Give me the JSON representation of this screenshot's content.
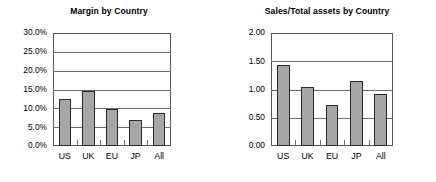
{
  "figure": {
    "background": "#ffffff",
    "bar_fill": "#a6a6a6",
    "bar_edge": "#2b2b2b",
    "grid_color": "#6d6e70",
    "axis_color": "#58585a"
  },
  "chart_data": [
    {
      "type": "bar",
      "title": "Margin by Country",
      "xlabel": "",
      "ylabel": "",
      "categories": [
        "US",
        "UK",
        "EU",
        "JP",
        "All"
      ],
      "values": [
        0.126,
        0.145,
        0.099,
        0.07,
        0.088
      ],
      "value_labels": [
        "12.6%",
        "14.5%",
        "9.9%",
        "7.0%",
        "8.8%"
      ],
      "ylim": [
        0,
        0.3
      ],
      "yticks": [
        0,
        0.05,
        0.1,
        0.15,
        0.2,
        0.25,
        0.3
      ],
      "ytick_labels": [
        "0.0%",
        "5.0%",
        "10.0%",
        "15.0%",
        "20.0%",
        "25.0%",
        "30.0%"
      ],
      "grid": true,
      "legend": "none"
    },
    {
      "type": "bar",
      "title": "Sales/Total assets by Country",
      "xlabel": "",
      "ylabel": "",
      "categories": [
        "US",
        "UK",
        "EU",
        "JP",
        "All"
      ],
      "values": [
        1.43,
        1.05,
        0.73,
        1.15,
        0.92
      ],
      "value_labels": [
        "1.43",
        "1.05",
        "0.73",
        "1.15",
        "0.92"
      ],
      "ylim": [
        0,
        2.0
      ],
      "yticks": [
        0,
        0.5,
        1.0,
        1.5,
        2.0
      ],
      "ytick_labels": [
        "0.00",
        "0.50",
        "1.00",
        "1.50",
        "2.00"
      ],
      "grid": true,
      "legend": "none"
    }
  ]
}
